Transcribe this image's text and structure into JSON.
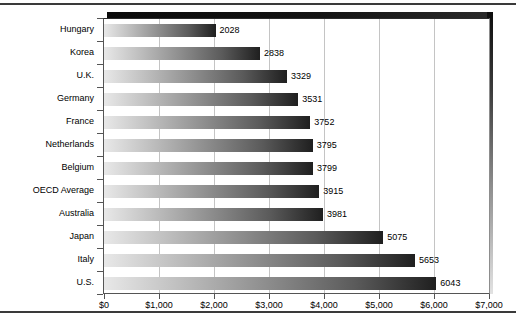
{
  "chart_data": {
    "type": "bar",
    "orientation": "horizontal",
    "title": "",
    "xlabel": "",
    "ylabel": "",
    "categories": [
      "Hungary",
      "Korea",
      "U.K.",
      "Germany",
      "France",
      "Netherlands",
      "Belgium",
      "OECD Average",
      "Australia",
      "Japan",
      "Italy",
      "U.S."
    ],
    "values": [
      2028,
      2838,
      3329,
      3531,
      3752,
      3795,
      3799,
      3915,
      3981,
      5075,
      5653,
      6043
    ],
    "value_labels": [
      "2028",
      "2838",
      "3329",
      "3531",
      "3752",
      "3795",
      "3799",
      "3915",
      "3981",
      "5075",
      "5653",
      "6043"
    ],
    "xlim": [
      0,
      7000
    ],
    "xticks": [
      0,
      1000,
      2000,
      3000,
      4000,
      5000,
      6000,
      7000
    ],
    "xtick_labels": [
      "$0",
      "$1,000",
      "$2,000",
      "$3,000",
      "$4,000",
      "$5,000",
      "$6,000",
      "$7,000"
    ],
    "grid": "vertical",
    "legend": "none",
    "bar_fill": "horizontal gradient light-gray to black",
    "colors": {
      "bar_start": "#e8e8e8",
      "bar_end": "#1f1f1f",
      "gridline": "#c4c4c4",
      "axis": "#555555",
      "frame_shadow": "#0b0b0b",
      "text": "#000000",
      "background": "#ffffff"
    }
  }
}
